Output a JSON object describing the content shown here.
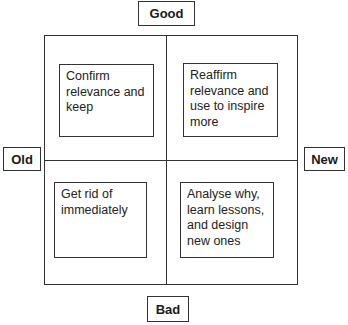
{
  "axes": {
    "top": "Good",
    "bottom": "Bad",
    "left": "Old",
    "right": "New"
  },
  "quadrants": {
    "top_left": "Confirm\nrelevance and\nkeep",
    "top_right": "Reaffirm\nrelevance and\nuse to inspire\nmore",
    "bottom_left": "Get rid of\nimmediately",
    "bottom_right": "Analyse why,\nlearn lessons,\nand design\nnew ones"
  }
}
